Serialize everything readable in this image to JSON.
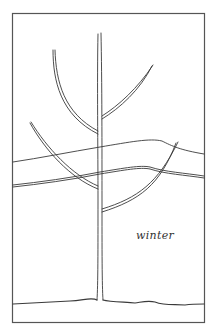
{
  "illustration": {
    "caption": "winter",
    "subject": "young tree with bare branches",
    "colors": {
      "ink": "#3a3a3a",
      "background": "#ffffff"
    }
  }
}
